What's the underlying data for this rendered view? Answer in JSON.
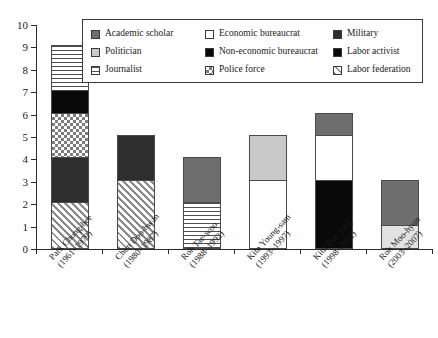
{
  "chart_data": {
    "type": "bar",
    "subtype": "stacked",
    "title": "",
    "xlabel": "",
    "ylabel": "",
    "ylim": [
      0,
      10
    ],
    "yticks": [
      0,
      1,
      2,
      3,
      4,
      5,
      6,
      7,
      8,
      9,
      10
    ],
    "grid": false,
    "legend_position": "top-inside",
    "categories": [
      "Park Chung-hee\n(1961–1979)",
      "Chun Doo-hwan\n(1980–1987)",
      "Roh Tae-woo\n(1988–1992)",
      "Kim Young-sam\n(1993–1997)",
      "Kim Dae-jung\n(1998–2002)",
      "Roh Moo-hyun\n(2003–2007)"
    ],
    "series": [
      {
        "name": "Academic scholar",
        "values": [
          0,
          0,
          2,
          0,
          1,
          2
        ]
      },
      {
        "name": "Politician",
        "values": [
          0,
          0,
          0,
          2,
          0,
          1
        ]
      },
      {
        "name": "Journalist",
        "values": [
          2,
          0,
          2,
          0,
          0,
          0
        ]
      },
      {
        "name": "Economic bureaucrat",
        "values": [
          0,
          0,
          0,
          3,
          2,
          0
        ]
      },
      {
        "name": "Non-economic bureaucrat",
        "values": [
          1,
          0,
          0,
          0,
          0,
          0
        ]
      },
      {
        "name": "Police force",
        "values": [
          2,
          0,
          0,
          0,
          0,
          0
        ]
      },
      {
        "name": "Military",
        "values": [
          2,
          2,
          0,
          0,
          0,
          0
        ]
      },
      {
        "name": "Labor activist",
        "values": [
          0,
          0,
          0,
          0,
          3,
          0
        ]
      },
      {
        "name": "Labor federation",
        "values": [
          2,
          3,
          0,
          0,
          0,
          0
        ]
      }
    ],
    "totals": [
      9,
      5,
      4,
      5,
      6,
      3
    ]
  },
  "axis": {
    "y_tick_labels": [
      "0",
      "1",
      "2",
      "3",
      "4",
      "5",
      "6",
      "7",
      "8",
      "9",
      "10"
    ]
  },
  "x_labels": [
    {
      "name": "Park Chung-hee",
      "years": "(1961–1979)"
    },
    {
      "name": "Chun Doo-hwan",
      "years": "(1980–1987)"
    },
    {
      "name": "Roh Tae-woo",
      "years": "(1988–1992)"
    },
    {
      "name": "Kim Young-sam",
      "years": "(1993–1997)"
    },
    {
      "name": "Kim Dae-jung",
      "years": "(1998–2002)"
    },
    {
      "name": "Roh Moo-hyun",
      "years": "(2003–2007)"
    }
  ],
  "legend": {
    "items": [
      {
        "label": "Academic scholar",
        "swatch": "academic",
        "color": "#6e6e6e"
      },
      {
        "label": "Economic bureaucrat",
        "swatch": "econ",
        "color": "#ffffff"
      },
      {
        "label": "Military",
        "swatch": "military",
        "color": "#2e2e2e"
      },
      {
        "label": "Politician",
        "swatch": "politician",
        "color": "#c9c9c9"
      },
      {
        "label": "Non-economic bureaucrat",
        "swatch": "nonecon",
        "color": "#0a0a0a"
      },
      {
        "label": "Labor activist",
        "swatch": "laboract",
        "color": "#0a0a0a"
      },
      {
        "label": "Journalist",
        "swatch": "journalist",
        "color": "#4f4f4f"
      },
      {
        "label": "Police force",
        "swatch": "police",
        "color": "#7d7d7d"
      },
      {
        "label": "Labor federation",
        "swatch": "laborfed",
        "color": "#8a8a8a"
      }
    ]
  },
  "bars": [
    {
      "index": 0,
      "total": 9,
      "segments": [
        {
          "fill": "laborfed",
          "from": 0,
          "to": 2,
          "value": 2,
          "series": "Labor federation"
        },
        {
          "fill": "military",
          "from": 2,
          "to": 4,
          "value": 2,
          "series": "Military"
        },
        {
          "fill": "police",
          "from": 4,
          "to": 6,
          "value": 2,
          "series": "Police force"
        },
        {
          "fill": "nonecon",
          "from": 6,
          "to": 7,
          "value": 1,
          "series": "Non-economic bureaucrat"
        },
        {
          "fill": "journalist",
          "from": 7,
          "to": 9,
          "value": 2,
          "series": "Journalist"
        }
      ]
    },
    {
      "index": 1,
      "total": 5,
      "segments": [
        {
          "fill": "laborfed",
          "from": 0,
          "to": 3,
          "value": 3,
          "series": "Labor federation"
        },
        {
          "fill": "military",
          "from": 3,
          "to": 5,
          "value": 2,
          "series": "Military"
        }
      ]
    },
    {
      "index": 2,
      "total": 4,
      "segments": [
        {
          "fill": "journalist",
          "from": 0,
          "to": 2,
          "value": 2,
          "series": "Journalist"
        },
        {
          "fill": "academic",
          "from": 2,
          "to": 4,
          "value": 2,
          "series": "Academic scholar"
        }
      ]
    },
    {
      "index": 3,
      "total": 5,
      "segments": [
        {
          "fill": "econ",
          "from": 0,
          "to": 3,
          "value": 3,
          "series": "Economic bureaucrat"
        },
        {
          "fill": "politician",
          "from": 3,
          "to": 5,
          "value": 2,
          "series": "Politician"
        }
      ]
    },
    {
      "index": 4,
      "total": 6,
      "segments": [
        {
          "fill": "laboract",
          "from": 0,
          "to": 3,
          "value": 3,
          "series": "Labor activist"
        },
        {
          "fill": "econ",
          "from": 3,
          "to": 5,
          "value": 2,
          "series": "Economic bureaucrat"
        },
        {
          "fill": "academic",
          "from": 5,
          "to": 6,
          "value": 1,
          "series": "Academic scholar"
        }
      ]
    },
    {
      "index": 5,
      "total": 3,
      "segments": [
        {
          "fill": "politician-light",
          "from": 0,
          "to": 1,
          "value": 1,
          "series": "Politician"
        },
        {
          "fill": "academic",
          "from": 1,
          "to": 3,
          "value": 2,
          "series": "Academic scholar"
        }
      ]
    }
  ]
}
